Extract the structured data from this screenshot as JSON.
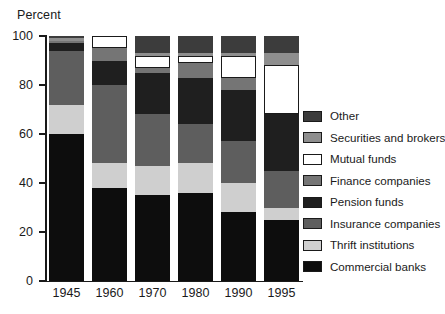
{
  "chart_data": {
    "type": "bar",
    "subtype": "stacked-percent",
    "title": "",
    "ylabel": "Percent",
    "xlabel": "",
    "ylim": [
      0,
      100
    ],
    "yticks": [
      0,
      20,
      40,
      60,
      80,
      100
    ],
    "ytick_labels": [
      "0",
      "20",
      "40",
      "60",
      "80",
      "100"
    ],
    "grid": false,
    "legend_position": "right",
    "categories": [
      "1945",
      "1960",
      "1970",
      "1980",
      "1990",
      "1995"
    ],
    "series": [
      {
        "name": "Commercial banks",
        "color": "#0d0d0d",
        "values": [
          60,
          38,
          35,
          36,
          28,
          25
        ]
      },
      {
        "name": "Thrift institutions",
        "color": "#cfcfcf",
        "values": [
          12,
          10,
          12,
          12,
          12,
          5
        ]
      },
      {
        "name": "Insurance companies",
        "color": "#5e5e5e",
        "values": [
          22,
          32,
          21,
          16,
          17,
          15
        ]
      },
      {
        "name": "Pension funds",
        "color": "#1f1f1f",
        "values": [
          3,
          10,
          17,
          19,
          21,
          23
        ]
      },
      {
        "name": "Finance companies",
        "color": "#757575",
        "values": [
          1,
          5,
          2,
          6,
          5,
          0
        ]
      },
      {
        "name": "Mutual funds",
        "color": "#ffffff",
        "values": [
          0,
          5,
          5,
          3,
          9,
          20
        ]
      },
      {
        "name": "Securities and brokers",
        "color": "#8e8e8e",
        "values": [
          1,
          0,
          1,
          1,
          1,
          5
        ]
      },
      {
        "name": "Other",
        "color": "#3c3c3c",
        "values": [
          1,
          0,
          7,
          7,
          7,
          7
        ]
      }
    ]
  },
  "legend": {
    "items": [
      {
        "label": "Other",
        "color": "#3c3c3c"
      },
      {
        "label": "Securities and brokers",
        "color": "#8e8e8e"
      },
      {
        "label": "Mutual funds",
        "color": "#ffffff"
      },
      {
        "label": "Finance companies",
        "color": "#757575"
      },
      {
        "label": "Pension funds",
        "color": "#1f1f1f"
      },
      {
        "label": "Insurance companies",
        "color": "#5e5e5e"
      },
      {
        "label": "Thrift institutions",
        "color": "#cfcfcf"
      },
      {
        "label": "Commercial banks",
        "color": "#0d0d0d"
      }
    ]
  },
  "axis": {
    "y_title": "Percent"
  }
}
